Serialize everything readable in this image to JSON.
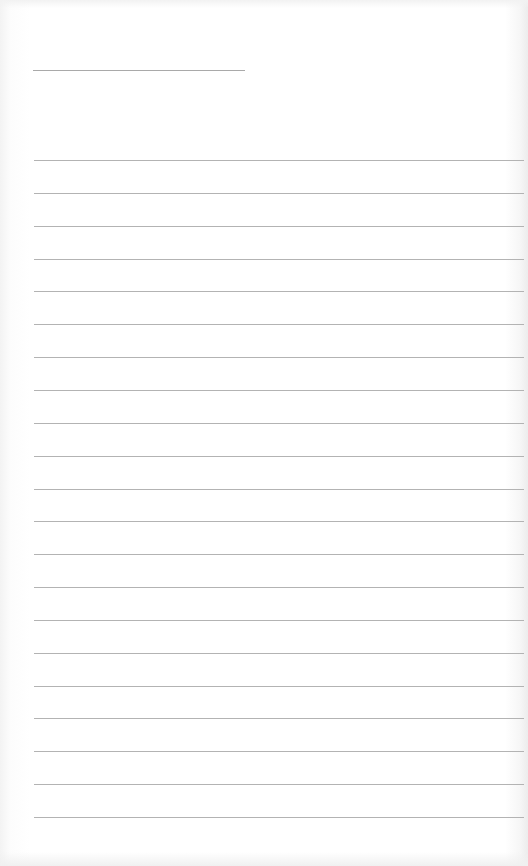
{
  "page": {
    "type": "lined-paper",
    "title_line": {
      "text": ""
    },
    "ruled_lines": [
      {
        "text": ""
      },
      {
        "text": ""
      },
      {
        "text": ""
      },
      {
        "text": ""
      },
      {
        "text": ""
      },
      {
        "text": ""
      },
      {
        "text": ""
      },
      {
        "text": ""
      },
      {
        "text": ""
      },
      {
        "text": ""
      },
      {
        "text": ""
      },
      {
        "text": ""
      },
      {
        "text": ""
      },
      {
        "text": ""
      },
      {
        "text": ""
      },
      {
        "text": ""
      },
      {
        "text": ""
      },
      {
        "text": ""
      },
      {
        "text": ""
      },
      {
        "text": ""
      },
      {
        "text": ""
      }
    ],
    "line_color": "#b3b3b3",
    "paper_color": "#ffffff"
  }
}
